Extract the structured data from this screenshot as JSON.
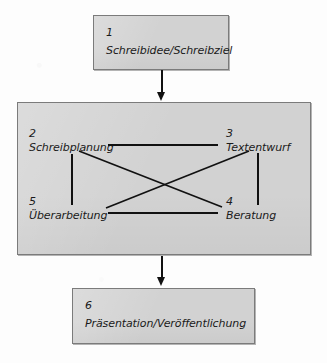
{
  "diagram": {
    "background_color": "#fdfdfd",
    "box_fill_color": "#d2d2d2",
    "box_border_color": "#7b7b7b",
    "line_color": "#111111",
    "nodes": [
      {
        "id": "1",
        "number": "1",
        "label": "Schreibidee/Schreibziel"
      },
      {
        "id": "2",
        "number": "2",
        "label": "Schreibplanung"
      },
      {
        "id": "3",
        "number": "3",
        "label": "Textentwurf"
      },
      {
        "id": "4",
        "number": "4",
        "label": "Beratung"
      },
      {
        "id": "5",
        "number": "5",
        "label": "Überarbeitung"
      },
      {
        "id": "6",
        "number": "6",
        "label": "Präsentation/Veröffentlichung"
      }
    ],
    "arrows": [
      {
        "from": "1",
        "to": "phase-group",
        "direction": "down"
      },
      {
        "from": "phase-group",
        "to": "6",
        "direction": "down"
      }
    ],
    "connectors": [
      {
        "from": "2",
        "to": "3",
        "style": "horizontal"
      },
      {
        "from": "5",
        "to": "4",
        "style": "horizontal"
      },
      {
        "from": "2",
        "to": "5",
        "style": "vertical"
      },
      {
        "from": "3",
        "to": "4",
        "style": "vertical"
      },
      {
        "from": "2",
        "to": "4",
        "style": "diagonal"
      },
      {
        "from": "3",
        "to": "5",
        "style": "diagonal"
      }
    ]
  }
}
